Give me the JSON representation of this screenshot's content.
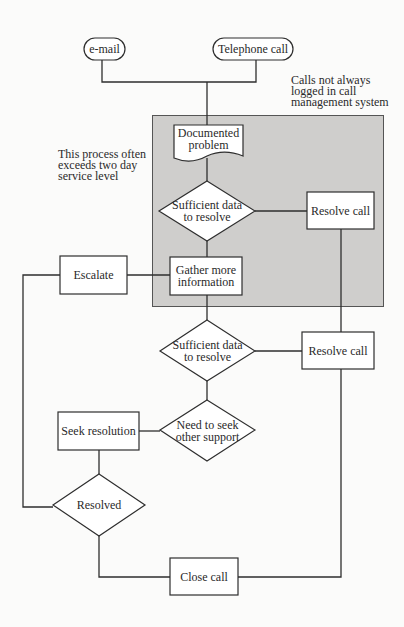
{
  "diagram": {
    "type": "flowchart",
    "colors": {
      "line": "#2e2e2e",
      "shade": "#cfcecc",
      "box_fill": "#ffffff",
      "background": "#fbfbfa"
    },
    "annotations": {
      "calls_note": "Calls not always logged in call management system",
      "calls_note_lines": [
        "Calls not always",
        "logged in call",
        "management system"
      ],
      "process_note": "This process often exceeds two day service level",
      "process_note_lines": [
        "This process often",
        "exceeds two day",
        "service level"
      ]
    },
    "nodes": {
      "email": {
        "shape": "terminator",
        "label": "e-mail"
      },
      "telephone": {
        "shape": "terminator",
        "label": "Telephone call"
      },
      "documented_problem": {
        "shape": "document",
        "label": "Documented problem",
        "lines": [
          "Documented",
          "problem"
        ]
      },
      "decision_sufficient_1": {
        "shape": "decision",
        "label": "Sufficient data to resolve",
        "lines": [
          "Sufficient data",
          "to resolve"
        ]
      },
      "resolve_call_1": {
        "shape": "process",
        "label": "Resolve call"
      },
      "escalate": {
        "shape": "process",
        "label": "Escalate"
      },
      "gather_info": {
        "shape": "process",
        "label": "Gather more information",
        "lines": [
          "Gather more",
          "information"
        ]
      },
      "decision_sufficient_2": {
        "shape": "decision",
        "label": "Sufficient data to resolve",
        "lines": [
          "Sufficient data",
          "to resolve"
        ]
      },
      "resolve_call_2": {
        "shape": "process",
        "label": "Resolve call"
      },
      "decision_seek_support": {
        "shape": "decision",
        "label": "Need to seek other support",
        "lines": [
          "Need to seek",
          "other support"
        ]
      },
      "seek_resolution": {
        "shape": "process",
        "label": "Seek resolution"
      },
      "decision_resolved": {
        "shape": "decision",
        "label": "Resolved"
      },
      "close_call": {
        "shape": "process",
        "label": "Close call"
      }
    },
    "edges": [
      [
        "email",
        "documented_problem"
      ],
      [
        "telephone",
        "documented_problem"
      ],
      [
        "documented_problem",
        "decision_sufficient_1"
      ],
      [
        "decision_sufficient_1",
        "resolve_call_1"
      ],
      [
        "decision_sufficient_1",
        "gather_info"
      ],
      [
        "gather_info",
        "escalate"
      ],
      [
        "gather_info",
        "decision_sufficient_2"
      ],
      [
        "decision_sufficient_2",
        "resolve_call_2"
      ],
      [
        "decision_sufficient_2",
        "decision_seek_support"
      ],
      [
        "decision_seek_support",
        "seek_resolution"
      ],
      [
        "seek_resolution",
        "decision_resolved"
      ],
      [
        "escalate",
        "decision_resolved"
      ],
      [
        "decision_resolved",
        "close_call"
      ],
      [
        "resolve_call_1",
        "close_call"
      ],
      [
        "resolve_call_2",
        "close_call"
      ]
    ]
  }
}
